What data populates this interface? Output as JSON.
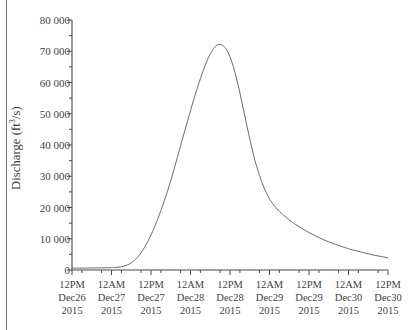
{
  "figure": {
    "background_color": "#ffffff",
    "border_color": "#6f6f6f",
    "line_color": "#6b6b6b",
    "axis_color": "#4a4a4a",
    "text_color": "#3f3f3f"
  },
  "axes": {
    "y_axis_label": "Discharge (ft",
    "y_axis_label_sup": "3",
    "y_axis_label_tail": "/s)",
    "y_ticks": [
      "80 000",
      "70 000",
      "60 000",
      "50 000",
      "40 000",
      "30 000",
      "20 000",
      "10 000",
      "0"
    ],
    "y_tick_values": [
      80000,
      70000,
      60000,
      50000,
      40000,
      30000,
      20000,
      10000,
      0
    ],
    "x_ticks": [
      {
        "time": "12PM",
        "date": "Dec26",
        "year": "2015"
      },
      {
        "time": "12AM",
        "date": "Dec27",
        "year": "2015"
      },
      {
        "time": "12PM",
        "date": "Dec27",
        "year": "2015"
      },
      {
        "time": "12AM",
        "date": "Dec28",
        "year": "2015"
      },
      {
        "time": "12PM",
        "date": "Dec28",
        "year": "2015"
      },
      {
        "time": "12AM",
        "date": "Dec29",
        "year": "2015"
      },
      {
        "time": "12PM",
        "date": "Dec29",
        "year": "2015"
      },
      {
        "time": "12AM",
        "date": "Dec30",
        "year": "2015"
      },
      {
        "time": "12PM",
        "date": "Dec30",
        "year": "2015"
      }
    ]
  },
  "chart_data": {
    "type": "line",
    "title": "",
    "subtitle": "",
    "xlabel": "",
    "ylabel": "Discharge (ft3/s)",
    "ylim": [
      0,
      80000
    ],
    "xlim": [
      0,
      96
    ],
    "grid": false,
    "legend": null,
    "x_unit": "hours since 12PM Dec26 2015",
    "x_tick_labels": [
      "12PM Dec26 2015",
      "12AM Dec27 2015",
      "12PM Dec27 2015",
      "12AM Dec28 2015",
      "12PM Dec28 2015",
      "12AM Dec29 2015",
      "12PM Dec29 2015",
      "12AM Dec30 2015",
      "12PM Dec30 2015"
    ],
    "x_tick_values": [
      0,
      12,
      24,
      36,
      48,
      60,
      72,
      84,
      96
    ],
    "series": [
      {
        "name": "Discharge",
        "color": "#6b6b6b",
        "x": [
          0,
          2,
          4,
          6,
          8,
          10,
          12,
          13,
          14,
          15,
          16,
          17,
          18,
          19,
          20,
          21,
          22,
          23,
          24,
          25,
          26,
          27,
          28,
          29,
          30,
          31,
          32,
          33,
          34,
          35,
          36,
          37,
          38,
          39,
          40,
          41,
          42,
          43,
          44,
          45,
          46,
          47,
          48,
          49,
          50,
          51,
          52,
          53,
          54,
          55,
          56,
          58,
          60,
          62,
          64,
          66,
          68,
          70,
          72,
          74,
          76,
          78,
          80,
          82,
          84,
          86,
          88,
          90,
          92,
          94,
          96
        ],
        "y": [
          600,
          600,
          620,
          640,
          660,
          700,
          760,
          820,
          900,
          1050,
          1300,
          1700,
          2300,
          3100,
          4200,
          5600,
          7200,
          9100,
          11200,
          13600,
          16200,
          19000,
          22000,
          25200,
          28600,
          32200,
          36000,
          39800,
          43600,
          47300,
          51000,
          54600,
          58000,
          61200,
          64200,
          66900,
          69100,
          70800,
          71900,
          72200,
          71700,
          70400,
          68200,
          65100,
          61200,
          56700,
          51800,
          46800,
          42000,
          37500,
          33500,
          27200,
          22800,
          19900,
          17800,
          16000,
          14500,
          13200,
          12000,
          10900,
          9900,
          9000,
          8200,
          7500,
          6800,
          6200,
          5700,
          5200,
          4700,
          4300,
          3900
        ],
        "peak_value": 72200,
        "peak_x_label": "approx 6PM Dec28 2015",
        "baseline_value": 600,
        "final_value": 3900
      }
    ]
  }
}
